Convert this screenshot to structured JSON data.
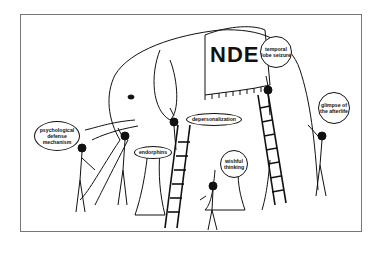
{
  "illustration": {
    "subject": "Blind men and the elephant cartoon",
    "elephant_blanket_label": "NDE",
    "labels": [
      {
        "id": "psychological",
        "text": "psychological defense mechanism"
      },
      {
        "id": "endorphins",
        "text": "endorphins"
      },
      {
        "id": "depersonalization",
        "text": "depersonalization"
      },
      {
        "id": "temporal",
        "text": "temporal lobe seizure"
      },
      {
        "id": "wishful",
        "text": "wishful thinking"
      },
      {
        "id": "glimpse",
        "text": "glimpse of the afterlife"
      }
    ]
  }
}
